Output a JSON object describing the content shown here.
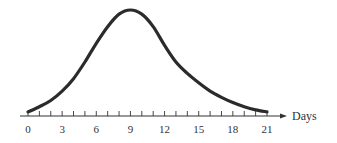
{
  "chart_data": {
    "type": "line",
    "title": "",
    "xlabel": "Days",
    "ylabel": "",
    "x_ticks": [
      0,
      3,
      6,
      9,
      12,
      15,
      18,
      21
    ],
    "x_tick_labels": [
      "0",
      "3",
      "6",
      "9",
      "12",
      "15",
      "18",
      "21"
    ],
    "minor_tick_step": 1,
    "xlim": [
      0,
      21
    ],
    "y_axis_shown": false,
    "grid": false,
    "legend": null,
    "series": [
      {
        "name": "curve",
        "description": "Skewed bell-shaped curve rising from near zero at day 0, peaking at day 9, then decaying toward zero at day 21 (relative height, 0-1)",
        "x": [
          0,
          1,
          2,
          3,
          4,
          5,
          6,
          7,
          8,
          9,
          10,
          11,
          12,
          13,
          14,
          15,
          16,
          17,
          18,
          19,
          20,
          21
        ],
        "values": [
          0.02,
          0.07,
          0.13,
          0.22,
          0.34,
          0.5,
          0.68,
          0.84,
          0.96,
          1.0,
          0.96,
          0.84,
          0.66,
          0.5,
          0.39,
          0.3,
          0.22,
          0.16,
          0.11,
          0.07,
          0.04,
          0.02
        ]
      }
    ],
    "colors": {
      "curve": "#2b2b2b",
      "axis": "#333333",
      "text": "#333333"
    }
  }
}
